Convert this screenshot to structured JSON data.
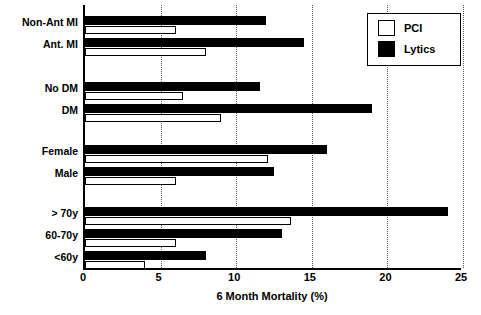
{
  "chart_data": {
    "type": "bar",
    "orientation": "horizontal",
    "title": "",
    "xlabel": "6 Month Mortality (%)",
    "ylabel": "",
    "xlim": [
      0,
      25
    ],
    "xticks": [
      0,
      5,
      10,
      15,
      20,
      25
    ],
    "grid": "vertical-dotted",
    "legend_position": "top-right",
    "categories": [
      "Non-Ant MI",
      "Ant. MI",
      "No DM",
      "DM",
      "Female",
      "Male",
      "> 70y",
      "60-70y",
      "<60y"
    ],
    "series": [
      {
        "name": "PCI",
        "color": "#ffffff",
        "values": [
          6.0,
          8.0,
          6.5,
          9.0,
          12.1,
          6.0,
          13.6,
          6.0,
          4.0
        ]
      },
      {
        "name": "Lytics",
        "color": "#000000",
        "values": [
          12.0,
          14.5,
          11.6,
          19.0,
          16.0,
          12.5,
          24.0,
          13.0,
          8.0
        ]
      }
    ],
    "groups": [
      {
        "name": "infarct-location",
        "categories": [
          "Non-Ant MI",
          "Ant. MI"
        ]
      },
      {
        "name": "diabetes-status",
        "categories": [
          "No DM",
          "DM"
        ]
      },
      {
        "name": "sex",
        "categories": [
          "Female",
          "Male"
        ]
      },
      {
        "name": "age",
        "categories": [
          "> 70y",
          "60-70y",
          "<60y"
        ]
      }
    ]
  },
  "legend": {
    "items": [
      {
        "label": "PCI",
        "swatch": "open-square"
      },
      {
        "label": "Lytics",
        "swatch": "filled-square"
      }
    ]
  },
  "axis": {
    "x_tick_labels": [
      "0",
      "5",
      "10",
      "15",
      "20",
      "25"
    ],
    "x_title": "6 Month Mortality (%)"
  },
  "rows": [
    {
      "label": "Non-Ant MI",
      "lytics": 12.0,
      "pci": 6.0,
      "y": 16
    },
    {
      "label": "Ant. MI",
      "lytics": 14.5,
      "pci": 8.0,
      "y": 38
    },
    {
      "label": "No DM",
      "lytics": 11.6,
      "pci": 6.5,
      "y": 82
    },
    {
      "label": "DM",
      "lytics": 19.0,
      "pci": 9.0,
      "y": 104
    },
    {
      "label": "Female",
      "lytics": 16.0,
      "pci": 12.1,
      "y": 145
    },
    {
      "label": "Male",
      "lytics": 12.5,
      "pci": 6.0,
      "y": 167
    },
    {
      "label": "> 70y",
      "lytics": 24.0,
      "pci": 13.6,
      "y": 207
    },
    {
      "label": "60-70y",
      "lytics": 13.0,
      "pci": 6.0,
      "y": 229
    },
    {
      "label": "<60y",
      "lytics": 8.0,
      "pci": 4.0,
      "y": 251
    }
  ]
}
